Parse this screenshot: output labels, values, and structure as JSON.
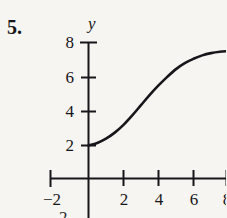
{
  "figure": {
    "problem_number": "5.",
    "background_color": "#f7f5f1",
    "ink_color": "#17161a"
  },
  "axes": {
    "y_axis_name": "y",
    "y_tick_labels": [
      "8",
      "6",
      "4",
      "2"
    ],
    "x_tick_labels": [
      "−2",
      "2",
      "4",
      "6",
      "8"
    ],
    "bleed_glyph": "2"
  },
  "chart_data": {
    "type": "line",
    "title": "",
    "xlabel": "",
    "ylabel": "y",
    "xlim": [
      -3,
      8.2
    ],
    "ylim": [
      -0.6,
      8.6
    ],
    "xticks": [
      -2,
      2,
      4,
      6,
      8
    ],
    "yticks": [
      2,
      4,
      6,
      8
    ],
    "xtick_labels": [
      "−2",
      "2",
      "4",
      "6",
      "8"
    ],
    "ytick_labels": [
      "2",
      "4",
      "6",
      "8"
    ],
    "grid": false,
    "legend": false,
    "series": [
      {
        "name": "curve",
        "color": "#17161a",
        "line_width": 2.6,
        "x": [
          0,
          0.5,
          1,
          1.5,
          2,
          2.5,
          3,
          3.5,
          4,
          4.5,
          5,
          5.5,
          6,
          6.5,
          7,
          7.5,
          8
        ],
        "y": [
          2.0,
          2.15,
          2.4,
          2.75,
          3.2,
          3.75,
          4.35,
          4.95,
          5.5,
          6.0,
          6.45,
          6.8,
          7.05,
          7.25,
          7.38,
          7.46,
          7.5
        ]
      }
    ]
  }
}
